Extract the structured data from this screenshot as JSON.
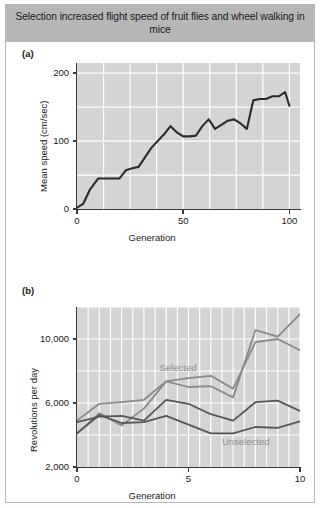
{
  "figure": {
    "title": "Selection increased flight speed of fruit flies and wheel walking in mice",
    "panel_a_label": "(a)",
    "panel_b_label": "(b)",
    "title_bg": "#b7b7b7",
    "plot_bg": "#d4d4d4",
    "grid_color": "#ffffff"
  },
  "chart_data": [
    {
      "id": "panel_a",
      "type": "line",
      "title": "",
      "xlabel": "Generation",
      "ylabel": "Mean speed (cm/sec)",
      "xlim": [
        0,
        105
      ],
      "ylim": [
        0,
        215
      ],
      "xticks": [
        0,
        50,
        100
      ],
      "xtick_labels": [
        "0",
        "50",
        "100"
      ],
      "yticks": [
        0,
        100,
        200
      ],
      "ytick_labels": [
        "0",
        "100",
        "200"
      ],
      "grid": true,
      "legend": "none",
      "line_color": "#2b2b2b",
      "series": [
        {
          "name": "Mean flight speed",
          "x": [
            0,
            3,
            6,
            10,
            14,
            17,
            20,
            23,
            26,
            29,
            32,
            35,
            38,
            41,
            44,
            47,
            50,
            53,
            56,
            59,
            62,
            65,
            68,
            71,
            74,
            77,
            80,
            83,
            86,
            89,
            92,
            95,
            98,
            100
          ],
          "y": [
            2,
            8,
            28,
            45,
            45,
            45,
            45,
            57,
            60,
            62,
            76,
            90,
            100,
            110,
            122,
            113,
            107,
            107,
            108,
            122,
            132,
            118,
            124,
            130,
            132,
            126,
            118,
            160,
            162,
            162,
            166,
            166,
            172,
            152
          ]
        }
      ]
    },
    {
      "id": "panel_b",
      "type": "line",
      "title": "",
      "xlabel": "Generation",
      "ylabel": "Revolutions per day",
      "xlim": [
        0,
        10
      ],
      "ylim": [
        2000,
        12000
      ],
      "xticks": [
        0,
        5,
        10
      ],
      "xtick_labels": [
        "0",
        "5",
        "10"
      ],
      "yticks": [
        2000,
        6000,
        10000
      ],
      "ytick_labels": [
        "2,000",
        "6,000",
        "10,000"
      ],
      "grid": true,
      "legend": "inline-annotations",
      "annotations": [
        {
          "text": "Selected",
          "x": 3.7,
          "y": 8150,
          "color": "#8d8d8d"
        },
        {
          "text": "Unselected",
          "x": 6.5,
          "y": 3500,
          "color": "#8d8d8d"
        }
      ],
      "series": [
        {
          "name": "Selected line 1",
          "group": "selected",
          "color": "#8a8a8a",
          "x": [
            0,
            1,
            2,
            3,
            4,
            5,
            6,
            7,
            8,
            9,
            10
          ],
          "y": [
            4900,
            5950,
            6050,
            6200,
            7350,
            7000,
            7050,
            6350,
            10550,
            10150,
            11550
          ]
        },
        {
          "name": "Selected line 2",
          "group": "selected",
          "color": "#8a8a8a",
          "x": [
            0,
            1,
            2,
            3,
            4,
            5,
            6,
            7,
            8,
            9,
            10
          ],
          "y": [
            4100,
            5350,
            4600,
            5650,
            7350,
            7550,
            7700,
            6900,
            9800,
            10000,
            9300
          ]
        },
        {
          "name": "Unselected line 1",
          "group": "unselected",
          "color": "#565656",
          "x": [
            0,
            1,
            2,
            3,
            4,
            5,
            6,
            7,
            8,
            9,
            10
          ],
          "y": [
            4800,
            5150,
            5200,
            4900,
            6200,
            5950,
            5300,
            4900,
            6050,
            6150,
            5500
          ]
        },
        {
          "name": "Unselected line 2",
          "group": "unselected",
          "color": "#565656",
          "x": [
            0,
            1,
            2,
            3,
            4,
            5,
            6,
            7,
            8,
            9,
            10
          ],
          "y": [
            4100,
            5250,
            4750,
            4800,
            5200,
            4650,
            4100,
            4100,
            4500,
            4450,
            4850
          ]
        }
      ]
    }
  ]
}
